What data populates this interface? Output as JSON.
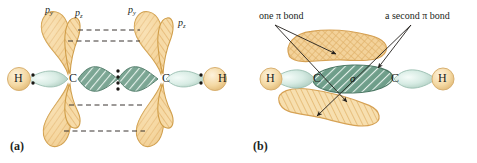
{
  "figure": {
    "background": "#ffffff"
  },
  "colors": {
    "p_orbital_fill": "#f3cd8e",
    "p_orbital_fill_light": "#fae5c2",
    "p_orbital_stroke": "#d9a44f",
    "p_orbital_hatch": "#e0b26a",
    "sigma_fill": "#7fa895",
    "sigma_fill_light": "#cfe3da",
    "sigma_stroke": "#4f7b68",
    "sigma_hatch": "#dff0e8",
    "h_sphere_fill": "#f6dfae",
    "h_sphere_stroke": "#d8b071",
    "sp_lobe_fill": "#dff0ea",
    "sp_lobe_stroke": "#9cbfb2",
    "text": "#231f1c",
    "dash_line": "#3a3530",
    "arrow": "#231f1c"
  },
  "panel_a": {
    "tag": "(a)",
    "orbital_labels": [
      {
        "id": "py-left",
        "base": "p",
        "sub": "y",
        "x": 45,
        "y": 6
      },
      {
        "id": "pz-left",
        "base": "p",
        "sub": "z",
        "x": 74,
        "y": 9
      },
      {
        "id": "py-right",
        "base": "p",
        "sub": "y",
        "x": 127,
        "y": 6
      },
      {
        "id": "pz-right",
        "base": "p",
        "sub": "z",
        "x": 177,
        "y": 19
      }
    ],
    "atoms": [
      {
        "id": "h-left",
        "label": "H",
        "x": 14,
        "y": 76
      },
      {
        "id": "c-left",
        "label": "C",
        "x": 70,
        "y": 75
      },
      {
        "id": "c-right",
        "label": "C",
        "x": 163,
        "y": 75
      },
      {
        "id": "h-right",
        "label": "H",
        "x": 219,
        "y": 76
      }
    ],
    "electron_pairs": [
      {
        "id": "ch-left-pair",
        "x": 32,
        "y": 82,
        "dots": 2
      },
      {
        "id": "cc-triple",
        "x": 117,
        "y": 82,
        "dots": 4
      },
      {
        "id": "ch-right-pair",
        "x": 202,
        "y": 82,
        "dots": 2
      }
    ],
    "dashed_guides": [
      {
        "id": "guide-top-1",
        "x1": 78,
        "y1": 30,
        "x2": 138,
        "y2": 30
      },
      {
        "id": "guide-top-2",
        "x1": 70,
        "y1": 40,
        "x2": 138,
        "y2": 40
      },
      {
        "id": "guide-bottom-1",
        "x1": 70,
        "y1": 104,
        "x2": 140,
        "y2": 104
      },
      {
        "id": "guide-bottom-2",
        "x1": 66,
        "y1": 130,
        "x2": 143,
        "y2": 130
      }
    ]
  },
  "panel_b": {
    "tag": "(b)",
    "annotations": [
      {
        "id": "one-pi-bond",
        "text": "one π bond",
        "x": 21,
        "y": 12
      },
      {
        "id": "second-pi-bond",
        "text": "a second π bond",
        "x": 148,
        "y": 12
      }
    ],
    "sigma_label": {
      "id": "sigma-symbol",
      "text": "σ",
      "x": 112,
      "y": 73
    },
    "atoms": [
      {
        "id": "h-left",
        "label": "H",
        "x": 28,
        "y": 76
      },
      {
        "id": "c-left",
        "label": "C",
        "x": 75,
        "y": 76
      },
      {
        "id": "c-right",
        "label": "C",
        "x": 152,
        "y": 76
      },
      {
        "id": "h-right",
        "label": "H",
        "x": 200,
        "y": 76
      }
    ],
    "arrows": [
      {
        "id": "arrow-one-pi-top",
        "from": [
          36,
          24
        ],
        "to": [
          95,
          54
        ]
      },
      {
        "id": "arrow-one-pi-bottom",
        "from": [
          36,
          24
        ],
        "to": [
          110,
          103
        ]
      },
      {
        "id": "arrow-second-top",
        "from": [
          171,
          24
        ],
        "to": [
          137,
          68
        ]
      },
      {
        "id": "arrow-second-bottom",
        "from": [
          171,
          24
        ],
        "to": [
          77,
          115
        ]
      }
    ]
  }
}
